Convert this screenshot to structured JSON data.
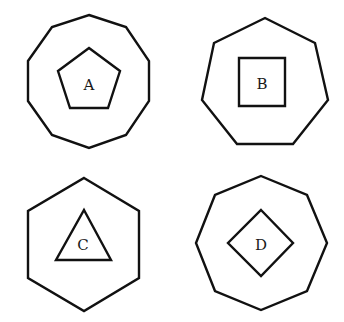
{
  "figures": [
    {
      "id": "A",
      "label": "A",
      "outer": {
        "shape": "decagon",
        "sides": 10,
        "points": "89,15 126,27 149,61 149,101 126,135 89,148 52,135 28,101 28,61 52,27"
      },
      "inner": {
        "shape": "pentagon",
        "sides": 5,
        "points": "89,48 120,71 108,108 70,108 58,71"
      },
      "label_pos": {
        "x": 89,
        "y": 85
      }
    },
    {
      "id": "B",
      "label": "B",
      "outer": {
        "shape": "heptagon",
        "sides": 7,
        "points": "265,18 315,43 328,100 293,144 237,144 202,100 214,43"
      },
      "inner": {
        "shape": "square",
        "sides": 4,
        "points": "239,58 285,58 285,106 239,106"
      },
      "label_pos": {
        "x": 262,
        "y": 84
      }
    },
    {
      "id": "C",
      "label": "C",
      "outer": {
        "shape": "hexagon",
        "sides": 6,
        "points": "84,178 139,211 139,278 84,311 28,278 28,211"
      },
      "inner": {
        "shape": "triangle",
        "sides": 3,
        "points": "84,210 111,260 56,260"
      },
      "label_pos": {
        "x": 83,
        "y": 245
      }
    },
    {
      "id": "D",
      "label": "D",
      "outer": {
        "shape": "octagon",
        "sides": 8,
        "points": "261,176 307,195 327,243 307,291 261,310 215,291 196,243 215,195"
      },
      "inner": {
        "shape": "diamond",
        "sides": 4,
        "points": "261,210 293,243 261,276 228,243"
      },
      "label_pos": {
        "x": 261,
        "y": 245
      }
    }
  ]
}
